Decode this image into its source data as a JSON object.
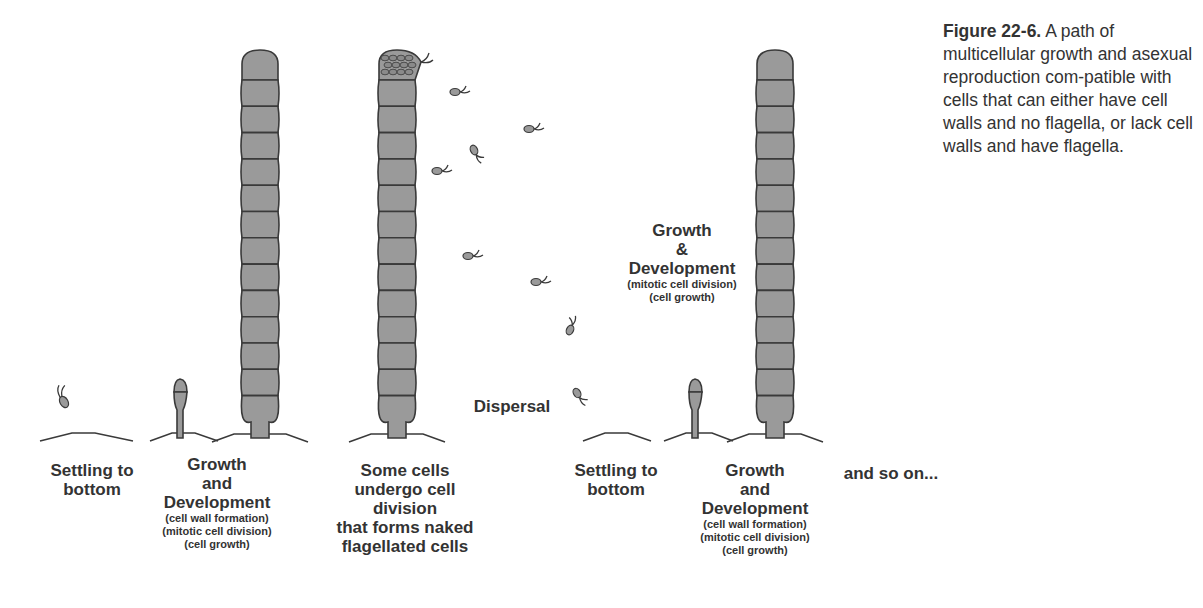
{
  "figure": {
    "caption_label": "Figure 22-6.",
    "caption_text": " A path of multicellular growth and asexual reproduction com-patible with cells that can either have cell walls and no flagella, or lack cell walls and have flagella."
  },
  "stages": [
    {
      "title": "Settling to bottom",
      "line1": "Settling to",
      "line2": "bottom"
    },
    {
      "title": "Growth and Development",
      "line1": "Growth",
      "line2": "and",
      "line3": "Development",
      "details": [
        "(cell wall formation)",
        "(mitotic cell division)",
        "(cell growth)"
      ]
    },
    {
      "title": "Some cells undergo cell division that forms naked flagellated cells",
      "line1": "Some cells",
      "line2": "undergo cell division",
      "line3": "that forms naked",
      "line4": "flagellated cells"
    },
    {
      "title": "Settling to bottom",
      "line1": "Settling to",
      "line2": "bottom"
    },
    {
      "title": "Growth and Development",
      "line1": "Growth",
      "line2": "and",
      "line3": "Development",
      "details": [
        "(cell wall formation)",
        "(mitotic cell division)",
        "(cell growth)"
      ]
    },
    {
      "title": "and so on...",
      "line1": "and so on..."
    }
  ],
  "mid_labels": {
    "dispersal": "Dispersal",
    "growth": {
      "line1": "Growth",
      "line2": "&",
      "line3": "Development",
      "details": [
        "(mitotic cell division)",
        "(cell growth)"
      ]
    }
  },
  "colors": {
    "cell_fill": "#9a9a9a",
    "outline": "#3a3a3a",
    "text": "#333333",
    "background": "#ffffff"
  }
}
